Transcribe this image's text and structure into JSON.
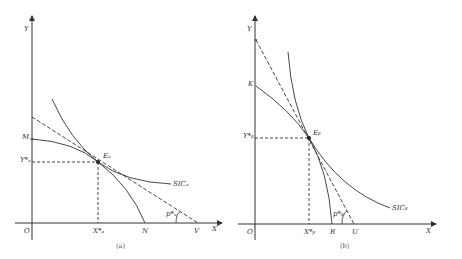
{
  "panels": [
    {
      "id": "a",
      "caption": "(a)",
      "axis_labels": {
        "y": "Y",
        "x": "X",
        "origin": "O"
      },
      "points": {
        "M": "M",
        "Y_star": "Y*ₐ",
        "E": "Eₐ",
        "X_star": "X*ₐ",
        "N": "N",
        "V": "V",
        "angle": "p*ₐ"
      },
      "curve_label": "SICₐ"
    },
    {
      "id": "b",
      "caption": "(b)",
      "axis_labels": {
        "y": "Y",
        "x": "X",
        "origin": "O"
      },
      "points": {
        "K": "K",
        "Y_star": "Y*ᵦ",
        "E": "Eᵦ",
        "X_star": "X*ᵦ",
        "R": "R",
        "U": "U",
        "angle": "p*ᵦ"
      },
      "curve_label": "SICᵦ"
    }
  ],
  "colors": {
    "line": "#333333",
    "background": "#ffffff"
  }
}
